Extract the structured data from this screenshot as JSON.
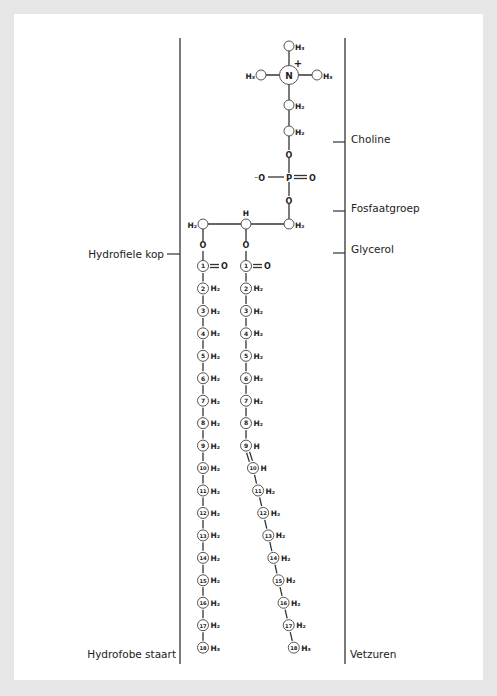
{
  "colors": {
    "background_frame": "#e6e6e6",
    "canvas": "#ffffff",
    "line": "#333333",
    "circle_stroke": "#555555",
    "text": "#222222"
  },
  "labels": {
    "left": {
      "hydrophilic_head": "Hydrofiele kop",
      "hydrophobic_tail": "Hydrofobe staart"
    },
    "right": {
      "choline": "Choline",
      "phosphate_group": "Fosfaatgroep",
      "glycerol": "Glycerol",
      "fatty_acids": "Vetzuren"
    }
  },
  "molecule": {
    "choline": {
      "nitrogen": {
        "symbol": "N",
        "charge": "+"
      },
      "methyl_groups": [
        "H₃",
        "H₃",
        "H₃"
      ],
      "methylene_groups": [
        "H₂",
        "H₂"
      ]
    },
    "phosphate": {
      "atoms": [
        "O",
        "P",
        "O",
        "O"
      ],
      "charged_oxygen": "⁻O",
      "double_bond_oxygen": "O"
    },
    "glycerol": {
      "carbons": [
        {
          "position": "left",
          "h": "H₂"
        },
        {
          "position": "middle",
          "h": "H"
        },
        {
          "position": "right",
          "h": "H₂"
        }
      ],
      "ester_oxygens": [
        "O",
        "O"
      ]
    },
    "fatty_acid_saturated": {
      "name": "left chain",
      "carbons": [
        {
          "n": "1",
          "h": "=O"
        },
        {
          "n": "2",
          "h": "H₂"
        },
        {
          "n": "3",
          "h": "H₂"
        },
        {
          "n": "4",
          "h": "H₂"
        },
        {
          "n": "5",
          "h": "H₂"
        },
        {
          "n": "6",
          "h": "H₂"
        },
        {
          "n": "7",
          "h": "H₂"
        },
        {
          "n": "8",
          "h": "H₂"
        },
        {
          "n": "9",
          "h": "H₂"
        },
        {
          "n": "10",
          "h": "H₂"
        },
        {
          "n": "11",
          "h": "H₂"
        },
        {
          "n": "12",
          "h": "H₂"
        },
        {
          "n": "13",
          "h": "H₂"
        },
        {
          "n": "14",
          "h": "H₂"
        },
        {
          "n": "15",
          "h": "H₂"
        },
        {
          "n": "16",
          "h": "H₂"
        },
        {
          "n": "17",
          "h": "H₂"
        },
        {
          "n": "18",
          "h": "H₃"
        }
      ]
    },
    "fatty_acid_unsaturated": {
      "name": "right chain",
      "double_bond_between": [
        9,
        10
      ],
      "carbons": [
        {
          "n": "1",
          "h": "=O"
        },
        {
          "n": "2",
          "h": "H₂"
        },
        {
          "n": "3",
          "h": "H₂"
        },
        {
          "n": "4",
          "h": "H₂"
        },
        {
          "n": "5",
          "h": "H₂"
        },
        {
          "n": "6",
          "h": "H₂"
        },
        {
          "n": "7",
          "h": "H₂"
        },
        {
          "n": "8",
          "h": "H₂"
        },
        {
          "n": "9",
          "h": "H"
        },
        {
          "n": "10",
          "h": "H"
        },
        {
          "n": "11",
          "h": "H₂"
        },
        {
          "n": "12",
          "h": "H₂"
        },
        {
          "n": "13",
          "h": "H₂"
        },
        {
          "n": "14",
          "h": "H₂"
        },
        {
          "n": "15",
          "h": "H₂"
        },
        {
          "n": "16",
          "h": "H₂"
        },
        {
          "n": "17",
          "h": "H₂"
        },
        {
          "n": "18",
          "h": "H₃"
        }
      ]
    }
  }
}
